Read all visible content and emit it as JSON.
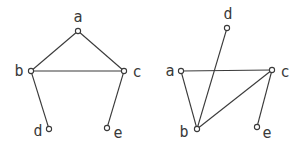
{
  "graphs": [
    {
      "name": "graph-left",
      "nodes": [
        {
          "id": "a",
          "label": "a",
          "x": 78,
          "y": 31,
          "lx": 78,
          "ly": 17
        },
        {
          "id": "b",
          "label": "b",
          "x": 31,
          "y": 71,
          "lx": 19,
          "ly": 71
        },
        {
          "id": "c",
          "label": "c",
          "x": 124,
          "y": 71,
          "lx": 137,
          "ly": 72
        },
        {
          "id": "d",
          "label": "d",
          "x": 49,
          "y": 129,
          "lx": 38,
          "ly": 131
        },
        {
          "id": "e",
          "label": "e",
          "x": 107,
          "y": 128,
          "lx": 118,
          "ly": 133
        }
      ],
      "edges": [
        [
          "a",
          "b"
        ],
        [
          "a",
          "c"
        ],
        [
          "b",
          "c"
        ],
        [
          "b",
          "d"
        ],
        [
          "c",
          "e"
        ]
      ]
    },
    {
      "name": "graph-right",
      "nodes": [
        {
          "id": "d",
          "label": "d",
          "x": 227,
          "y": 28,
          "lx": 228,
          "ly": 14
        },
        {
          "id": "a",
          "label": "a",
          "x": 181,
          "y": 71,
          "lx": 170,
          "ly": 71
        },
        {
          "id": "c",
          "label": "c",
          "x": 272,
          "y": 70,
          "lx": 285,
          "ly": 72
        },
        {
          "id": "b",
          "label": "b",
          "x": 197,
          "y": 129,
          "lx": 184,
          "ly": 132
        },
        {
          "id": "e",
          "label": "e",
          "x": 257,
          "y": 127,
          "lx": 267,
          "ly": 133
        }
      ],
      "edges": [
        [
          "d",
          "b"
        ],
        [
          "a",
          "b"
        ],
        [
          "a",
          "c"
        ],
        [
          "c",
          "b"
        ],
        [
          "c",
          "e"
        ]
      ]
    }
  ],
  "style": {
    "stroke": "#3a3a3a",
    "node_radius": 2.6
  }
}
